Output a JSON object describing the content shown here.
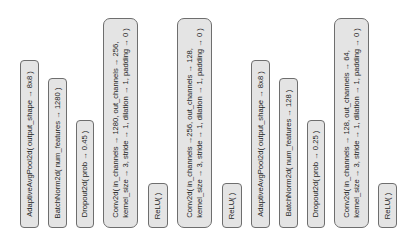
{
  "diagram": {
    "title": "",
    "style": {
      "fill": "#e4e4e4",
      "border": "#6e6e6e",
      "text": "#1e1e1e",
      "background": "#ffffff"
    },
    "layers": [
      {
        "id": "b1",
        "kind": "AdaptiveAvgPool2d",
        "lines": [
          "AdaptiveAvgPool2d( output_shape → 8x8 )"
        ]
      },
      {
        "id": "b2",
        "kind": "BatchNorm2d",
        "lines": [
          "BatchNorm2d( num_features → 1280 )"
        ]
      },
      {
        "id": "b3",
        "kind": "Dropout2d",
        "lines": [
          "Dropout2d( prob → 0.45 )"
        ]
      },
      {
        "id": "b4",
        "kind": "Conv2d",
        "lines": [
          "Conv2d( in_channels → 1280, out_channels → 256,",
          "kernel_size → 3, stride → 1, dilation → 1, padding → 0 )"
        ]
      },
      {
        "id": "b5",
        "kind": "ReLU",
        "lines": [
          "ReLU( )"
        ]
      },
      {
        "id": "b6",
        "kind": "Conv2d",
        "lines": [
          "Conv2d( in_channels →256, out_channels → 128,",
          "kernel_size → 3, stride → 1, dilation → 1, padding → 0 )"
        ]
      },
      {
        "id": "b7",
        "kind": "ReLU",
        "lines": [
          "ReLU( )"
        ]
      },
      {
        "id": "b8",
        "kind": "AdaptiveAvgPool2d",
        "lines": [
          "AdaptiveAvgPool2d( output_shape → 8x8 )"
        ]
      },
      {
        "id": "b9",
        "kind": "BatchNorm2d",
        "lines": [
          "BatchNorm2d( num_features → 128 )"
        ]
      },
      {
        "id": "b10",
        "kind": "Dropout2d",
        "lines": [
          "Dropout2d( prob → 0.25 )"
        ]
      },
      {
        "id": "b11",
        "kind": "Conv2d",
        "lines": [
          "Conv2d( in_channels → 128, out_channels → 64,",
          "kernel_size → 3, stride → 1, dilation → 1, padding → 0 )"
        ]
      },
      {
        "id": "b12",
        "kind": "ReLU",
        "lines": [
          "ReLU( )"
        ]
      }
    ]
  }
}
